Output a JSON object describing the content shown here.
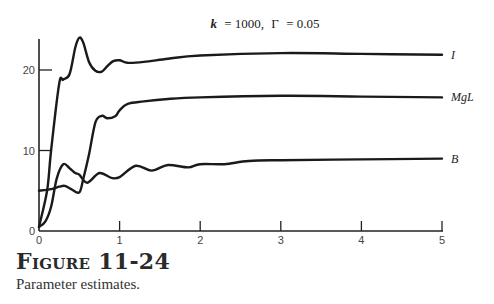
{
  "figure": {
    "number_label": "Figure 11-24",
    "caption": "Parameter estimates."
  },
  "chart_data": {
    "type": "line",
    "title": "k = 1000, Γ = 0.05",
    "title_parts": {
      "k_label": "k",
      "k_value": "= 1000,",
      "gamma_label": "Γ",
      "gamma_value": "= 0.05"
    },
    "xlabel": "",
    "ylabel": "",
    "xlim": [
      0,
      5
    ],
    "ylim": [
      0,
      24
    ],
    "x_ticks": [
      0,
      1,
      2,
      3,
      4,
      5
    ],
    "y_ticks": [
      0,
      10,
      20
    ],
    "grid": false,
    "legend": "inline labels at right end of each curve",
    "series": [
      {
        "name": "I",
        "x": [
          0.0,
          0.1,
          0.15,
          0.25,
          0.3,
          0.38,
          0.45,
          0.5,
          0.55,
          0.62,
          0.7,
          0.78,
          0.85,
          0.92,
          1.0,
          1.1,
          1.3,
          1.6,
          2.0,
          3.0,
          4.0,
          5.0
        ],
        "y": [
          0.5,
          5,
          10,
          18.3,
          18.8,
          19.5,
          22.8,
          24.0,
          23.4,
          21.0,
          19.9,
          19.8,
          20.5,
          21.1,
          21.2,
          20.9,
          21.0,
          21.4,
          21.8,
          22.1,
          22.0,
          21.9
        ]
      },
      {
        "name": "MgL",
        "x": [
          0.0,
          0.15,
          0.25,
          0.32,
          0.4,
          0.5,
          0.55,
          0.62,
          0.7,
          0.78,
          0.85,
          0.95,
          1.0,
          1.1,
          1.3,
          1.6,
          2.0,
          3.0,
          4.0,
          5.0
        ],
        "y": [
          5.0,
          5.2,
          5.5,
          5.6,
          5.2,
          4.8,
          6.5,
          9.5,
          13.5,
          14.3,
          14.0,
          14.3,
          15.0,
          15.8,
          16.1,
          16.4,
          16.6,
          16.8,
          16.7,
          16.6
        ]
      },
      {
        "name": "B",
        "x": [
          0.0,
          0.08,
          0.15,
          0.22,
          0.3,
          0.38,
          0.45,
          0.5,
          0.6,
          0.75,
          0.9,
          1.0,
          1.2,
          1.4,
          1.6,
          1.85,
          2.0,
          2.3,
          2.6,
          3.0,
          4.0,
          5.0
        ],
        "y": [
          0.5,
          1.2,
          3.0,
          6.5,
          8.3,
          7.8,
          7.2,
          7.0,
          6.0,
          7.2,
          6.6,
          6.7,
          8.1,
          7.5,
          8.2,
          7.9,
          8.3,
          8.3,
          8.7,
          8.8,
          8.9,
          9.0
        ]
      }
    ]
  }
}
